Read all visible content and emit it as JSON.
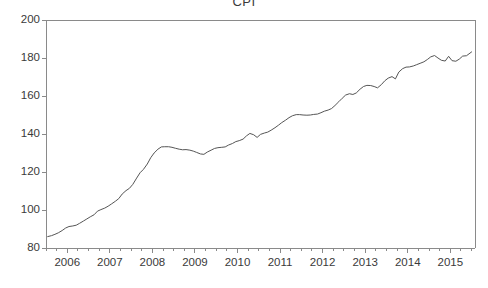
{
  "chart_data": {
    "type": "line",
    "title": "CPI",
    "xlabel": "",
    "ylabel": "",
    "ylim": [
      80,
      200
    ],
    "xlim": [
      2005.5,
      2015.58
    ],
    "grid": false,
    "legend": null,
    "yticks": [
      80,
      100,
      120,
      140,
      160,
      180,
      200
    ],
    "ytick_labels": [
      "80",
      "100",
      "120",
      "140",
      "160",
      "180",
      "200"
    ],
    "xticks": [
      2006,
      2007,
      2008,
      2009,
      2010,
      2011,
      2012,
      2013,
      2014,
      2015
    ],
    "xtick_labels": [
      "2006",
      "2007",
      "2008",
      "2009",
      "2010",
      "2011",
      "2012",
      "2013",
      "2014",
      "2015"
    ],
    "minor_xticks_per_year": 4,
    "line_color": "#555555",
    "line_width": 1,
    "series": [
      {
        "name": "CPI",
        "x": [
          2005.54,
          2005.63,
          2005.71,
          2005.79,
          2005.88,
          2005.96,
          2006.04,
          2006.13,
          2006.21,
          2006.29,
          2006.38,
          2006.46,
          2006.54,
          2006.63,
          2006.71,
          2006.79,
          2006.88,
          2006.96,
          2007.04,
          2007.13,
          2007.21,
          2007.29,
          2007.38,
          2007.46,
          2007.54,
          2007.63,
          2007.71,
          2007.79,
          2007.88,
          2007.96,
          2008.04,
          2008.13,
          2008.21,
          2008.29,
          2008.38,
          2008.46,
          2008.54,
          2008.63,
          2008.71,
          2008.79,
          2008.88,
          2008.96,
          2009.04,
          2009.13,
          2009.21,
          2009.29,
          2009.38,
          2009.46,
          2009.54,
          2009.63,
          2009.71,
          2009.79,
          2009.88,
          2009.96,
          2010.04,
          2010.13,
          2010.21,
          2010.29,
          2010.38,
          2010.46,
          2010.54,
          2010.63,
          2010.71,
          2010.79,
          2010.88,
          2010.96,
          2011.04,
          2011.13,
          2011.21,
          2011.29,
          2011.38,
          2011.46,
          2011.54,
          2011.63,
          2011.71,
          2011.79,
          2011.88,
          2011.96,
          2012.04,
          2012.13,
          2012.21,
          2012.29,
          2012.38,
          2012.46,
          2012.54,
          2012.63,
          2012.71,
          2012.79,
          2012.88,
          2012.96,
          2013.04,
          2013.13,
          2013.21,
          2013.29,
          2013.38,
          2013.46,
          2013.54,
          2013.63,
          2013.71,
          2013.79,
          2013.88,
          2013.96,
          2014.04,
          2014.13,
          2014.21,
          2014.29,
          2014.38,
          2014.46,
          2014.54,
          2014.63,
          2014.71,
          2014.79,
          2014.88,
          2014.96,
          2015.04,
          2015.13,
          2015.21,
          2015.29,
          2015.38,
          2015.5
        ],
        "values": [
          86.0,
          86.5,
          87.2,
          88.0,
          89.2,
          90.5,
          91.3,
          91.6,
          92.0,
          93.0,
          94.2,
          95.3,
          96.4,
          97.5,
          99.4,
          100.2,
          101.0,
          102.0,
          103.2,
          104.6,
          106.0,
          108.4,
          110.2,
          111.4,
          113.5,
          116.8,
          119.6,
          121.4,
          124.2,
          127.5,
          130.0,
          132.0,
          133.2,
          133.3,
          133.3,
          133.0,
          132.5,
          132.0,
          131.7,
          131.8,
          131.5,
          131.0,
          130.3,
          129.5,
          129.3,
          130.5,
          131.5,
          132.4,
          132.8,
          133.0,
          133.2,
          134.2,
          135.0,
          136.0,
          136.5,
          137.3,
          139.0,
          140.3,
          139.6,
          138.2,
          139.8,
          140.5,
          141.0,
          142.0,
          143.3,
          144.6,
          146.0,
          147.3,
          148.6,
          149.6,
          150.2,
          150.2,
          150.0,
          149.9,
          150.0,
          150.3,
          150.5,
          151.2,
          152.0,
          152.6,
          153.4,
          155.0,
          157.0,
          158.8,
          160.5,
          161.2,
          160.8,
          161.6,
          163.6,
          165.0,
          165.6,
          165.5,
          165.0,
          164.3,
          166.0,
          168.0,
          169.4,
          170.2,
          169.0,
          172.6,
          174.4,
          175.2,
          175.3,
          175.8,
          176.5,
          177.2,
          178.0,
          179.2,
          180.6,
          181.3,
          180.0,
          178.8,
          178.4,
          180.9,
          178.6,
          178.3,
          179.4,
          181.0,
          181.2,
          183.2
        ]
      }
    ]
  },
  "layout": {
    "plot_left": 46,
    "plot_right": 475,
    "plot_top": 20,
    "plot_bottom": 248
  }
}
